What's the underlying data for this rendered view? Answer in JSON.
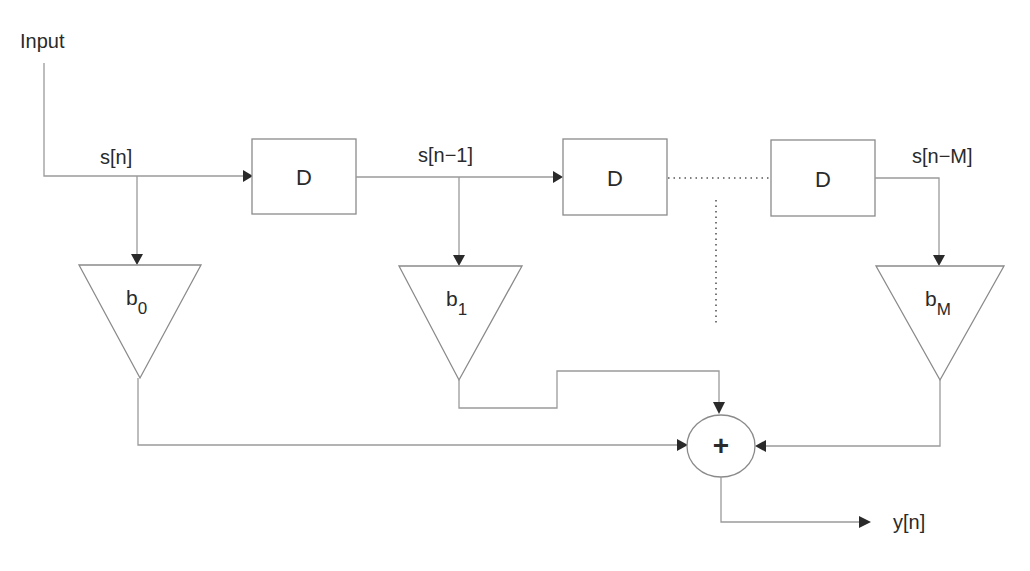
{
  "diagram": {
    "type": "FIR filter block diagram (tapped delay line)",
    "input_label": "Input",
    "signals": {
      "s0": "s[n]",
      "s1": "s[n−1]",
      "sM": "s[n−M]"
    },
    "delays": [
      {
        "label": "D"
      },
      {
        "label": "D"
      },
      {
        "label": "D"
      }
    ],
    "gains": [
      {
        "base": "b",
        "sub": "0"
      },
      {
        "base": "b",
        "sub": "1"
      },
      {
        "base": "b",
        "sub": "M"
      }
    ],
    "adder_symbol": "+",
    "output_label": "y[n]"
  }
}
